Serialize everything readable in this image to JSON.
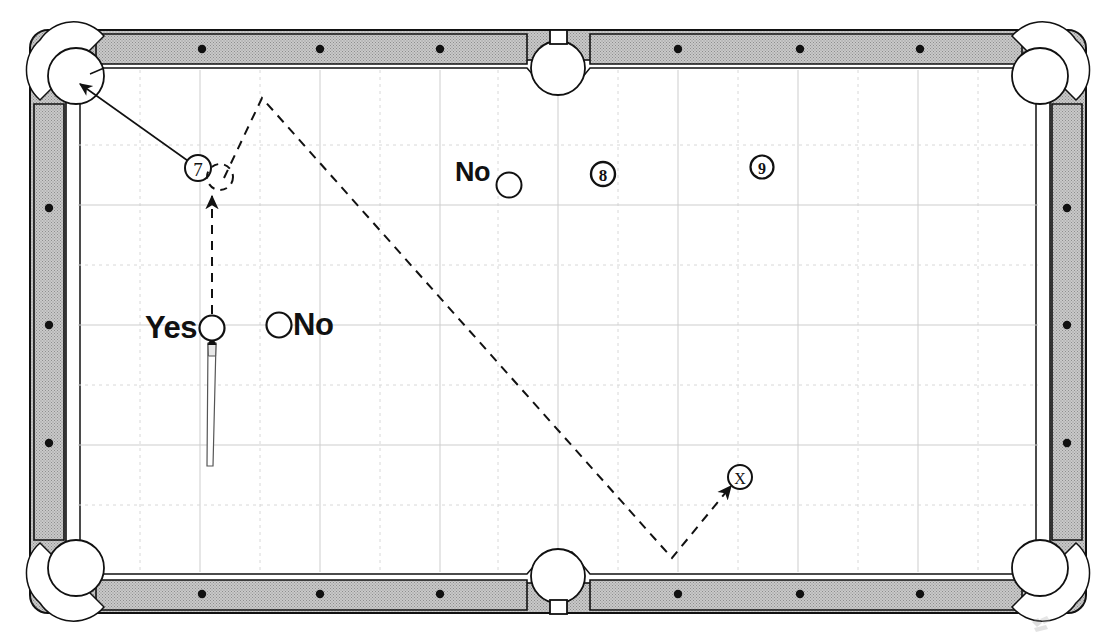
{
  "diagram": {
    "type": "billiards-table-shot-diagram",
    "table": {
      "rail_color": "#b5b5b5",
      "cloth_color": "#ffffff",
      "line_color": "#1a1a1a",
      "grid_color": "#cfcfcf",
      "pockets": [
        {
          "name": "top-left-corner-pocket",
          "cx": 76,
          "cy": 76
        },
        {
          "name": "top-side-pocket",
          "cx": 558,
          "cy": 68
        },
        {
          "name": "top-right-corner-pocket",
          "cx": 1040,
          "cy": 76
        },
        {
          "name": "bottom-left-corner-pocket",
          "cx": 76,
          "cy": 568
        },
        {
          "name": "bottom-side-pocket",
          "cx": 558,
          "cy": 576
        },
        {
          "name": "bottom-right-corner-pocket",
          "cx": 1040,
          "cy": 568
        }
      ],
      "diamonds_top": [
        202,
        320,
        440,
        678,
        800,
        920
      ],
      "diamonds_bottom": [
        202,
        320,
        440,
        678,
        800,
        920
      ],
      "diamonds_left": [
        208,
        325,
        443
      ],
      "diamonds_right": [
        208,
        325,
        443
      ]
    },
    "balls": [
      {
        "name": "ball-7",
        "label": "7",
        "style": "numbered-circle",
        "cx": 198,
        "cy": 168,
        "r": 13
      },
      {
        "name": "ghost-ball-7",
        "label": "",
        "style": "dashed-circle",
        "cx": 220,
        "cy": 176,
        "r": 13
      },
      {
        "name": "ball-no-top",
        "label": "No",
        "style": "open-circle-with-left-label",
        "cx": 509,
        "cy": 184,
        "r": 12
      },
      {
        "name": "ball-8",
        "label": "8",
        "style": "numbered-circle",
        "cx": 603,
        "cy": 174,
        "r": 12
      },
      {
        "name": "ball-9",
        "label": "9",
        "style": "numbered-circle",
        "cx": 762,
        "cy": 167,
        "r": 12
      },
      {
        "name": "cue-ball-yes",
        "label": "Yes",
        "style": "open-circle-with-left-label",
        "cx": 212,
        "cy": 328,
        "r": 12
      },
      {
        "name": "ball-no-mid",
        "label": "No",
        "style": "open-circle-with-right-label",
        "cx": 279,
        "cy": 325,
        "r": 12
      },
      {
        "name": "target-x",
        "label": "X",
        "style": "x-circle",
        "cx": 740,
        "cy": 477,
        "r": 12
      }
    ],
    "labels": {
      "yes": "Yes",
      "no_mid": "No",
      "no_top": "No"
    },
    "paths": [
      {
        "name": "solid-aim-line-to-corner-pocket",
        "style": "solid",
        "arrow": "start",
        "points": "78,83 198,168"
      },
      {
        "name": "dashed-cue-ball-path",
        "style": "dashed",
        "arrow": "none",
        "points": "212,328 212,190"
      },
      {
        "name": "dashed-bank-path",
        "style": "dashed",
        "arrow": "none",
        "points": "227,172 262,98 672,558 740,477"
      }
    ],
    "cue_stick": {
      "name": "cue-stick",
      "tip_x": 212,
      "tip_y": 340,
      "butt_x": 211,
      "butt_y": 465
    }
  }
}
